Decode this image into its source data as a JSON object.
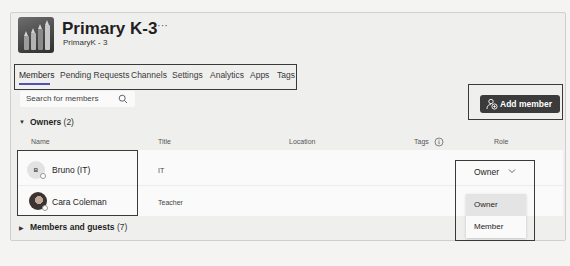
{
  "team": {
    "title": "Primary K-3",
    "more_label": "···",
    "subtitle": "PrimaryK - 3"
  },
  "tabs": [
    {
      "label": "Members",
      "active": true
    },
    {
      "label": "Pending Requests",
      "active": false
    },
    {
      "label": "Channels",
      "active": false
    },
    {
      "label": "Settings",
      "active": false
    },
    {
      "label": "Analytics",
      "active": false
    },
    {
      "label": "Apps",
      "active": false
    },
    {
      "label": "Tags",
      "active": false
    }
  ],
  "search": {
    "placeholder": "Search for members",
    "icon": "search-icon"
  },
  "add_member": {
    "label": "Add member",
    "icon": "add-person-icon",
    "color": "#3b3b3b"
  },
  "owners": {
    "label": "Owners",
    "count": "(2)",
    "expanded": true
  },
  "columns": {
    "name": "Name",
    "title": "Title",
    "location": "Location",
    "tags": "Tags",
    "role": "Role"
  },
  "rows": [
    {
      "initials": "B",
      "name": "Bruno (IT)",
      "title": "IT",
      "location": "",
      "tags": "",
      "role": "Owner"
    },
    {
      "initials": "",
      "name": "Cara Coleman",
      "title": "Teacher",
      "location": "",
      "tags": "",
      "role": ""
    }
  ],
  "role_dropdown": {
    "selected": "Owner",
    "options": [
      "Owner",
      "Member"
    ],
    "highlighted": "Owner"
  },
  "members_guests": {
    "label": "Members and guests",
    "count": "(7)",
    "expanded": false
  },
  "accent_color": "#4f52b2"
}
